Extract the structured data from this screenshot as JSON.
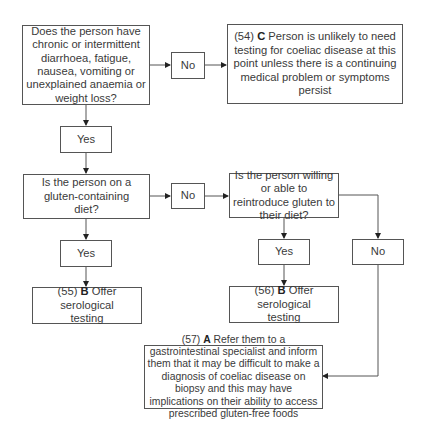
{
  "diagram": {
    "type": "flowchart",
    "nodes": {
      "q1": {
        "text": "Does the person have chronic or intermittent diarrhoea, fatigue, nausea, vomiting or unexplained anaemia or weight loss?"
      },
      "q1_no": {
        "text": "No"
      },
      "r54": {
        "num": "(54)",
        "grade": "C",
        "text": "Person is unlikely to need testing for coeliac disease at this point unless there is a continuing medical problem or symptoms persist"
      },
      "q1_yes": {
        "text": "Yes"
      },
      "q2": {
        "text": "Is the person on a gluten-containing diet?"
      },
      "q2_no": {
        "text": "No"
      },
      "q3": {
        "text": "Is the person willing or able to reintroduce gluten to their diet?"
      },
      "q2_yes": {
        "text": "Yes"
      },
      "q3_yes": {
        "text": "Yes"
      },
      "q3_no": {
        "text": "No"
      },
      "r55": {
        "num": "(55)",
        "grade": "B",
        "text": "Offer serological testing"
      },
      "r56": {
        "num": "(56)",
        "grade": "B",
        "text": "Offer serological testing"
      },
      "r57": {
        "num": "(57)",
        "grade": "A",
        "text": "Refer them to a gastrointestinal specialist and inform them that it may be difficult to make  a diagnosis of coeliac disease on biopsy and this may have implications on their ability to access prescribed gluten-free foods"
      }
    },
    "edges": [
      [
        "q1",
        "q1_no"
      ],
      [
        "q1_no",
        "r54"
      ],
      [
        "q1",
        "q1_yes"
      ],
      [
        "q1_yes",
        "q2"
      ],
      [
        "q2",
        "q2_no"
      ],
      [
        "q2_no",
        "q3"
      ],
      [
        "q2",
        "q2_yes"
      ],
      [
        "q2_yes",
        "r55"
      ],
      [
        "q3",
        "q3_yes"
      ],
      [
        "q3_yes",
        "r56"
      ],
      [
        "q3",
        "q3_no"
      ],
      [
        "q3_no",
        "r57"
      ]
    ],
    "colors": {
      "line": "#555555",
      "text": "#3a3a3a",
      "background": "#ffffff"
    }
  }
}
